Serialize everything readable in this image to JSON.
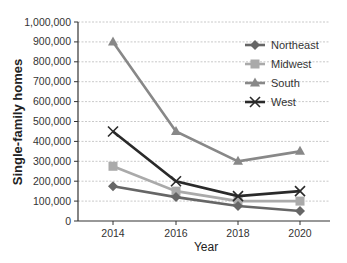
{
  "chart_data": {
    "type": "line",
    "title": "",
    "xlabel": "Year",
    "ylabel": "Single-family homes",
    "categories": [
      "2014",
      "2016",
      "2018",
      "2020"
    ],
    "ylim": [
      0,
      1000000
    ],
    "yticks": [
      "0",
      "100,000",
      "200,000",
      "300,000",
      "400,000",
      "500,000",
      "600,000",
      "700,000",
      "800,000",
      "900,000",
      "1,000,000"
    ],
    "grid": true,
    "legend_position": "upper right",
    "series": [
      {
        "name": "Northeast",
        "color": "#666666",
        "marker": "diamond",
        "values": [
          175000,
          120000,
          75000,
          50000
        ]
      },
      {
        "name": "Midwest",
        "color": "#aaaaaa",
        "marker": "square",
        "values": [
          275000,
          150000,
          100000,
          100000
        ]
      },
      {
        "name": "South",
        "color": "#888888",
        "marker": "triangle",
        "values": [
          900000,
          450000,
          300000,
          350000
        ]
      },
      {
        "name": "West",
        "color": "#2a2a2a",
        "marker": "x",
        "values": [
          450000,
          200000,
          125000,
          150000
        ]
      }
    ]
  }
}
